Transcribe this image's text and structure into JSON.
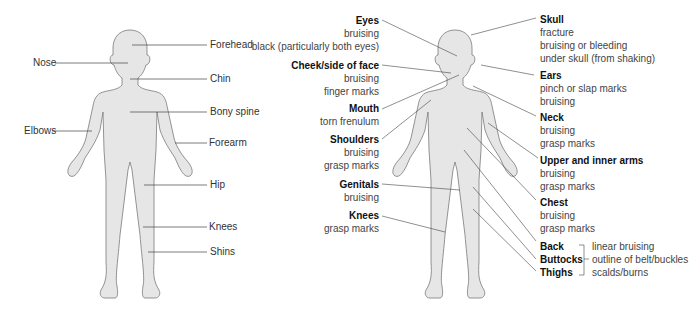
{
  "left_figure": {
    "labels": [
      {
        "id": "forehead",
        "text": "Forehead"
      },
      {
        "id": "nose",
        "text": "Nose"
      },
      {
        "id": "chin",
        "text": "Chin"
      },
      {
        "id": "bony_spine",
        "text": "Bony spine"
      },
      {
        "id": "elbows",
        "text": "Elbows"
      },
      {
        "id": "forearm",
        "text": "Forearm"
      },
      {
        "id": "hip",
        "text": "Hip"
      },
      {
        "id": "knees",
        "text": "Knees"
      },
      {
        "id": "shins",
        "text": "Shins"
      }
    ]
  },
  "right_figure": {
    "left_groups": [
      {
        "title": "Eyes",
        "lines": [
          "bruising",
          "black (particularly both eyes)"
        ]
      },
      {
        "title": "Cheek/side of face",
        "lines": [
          "bruising",
          "finger marks"
        ]
      },
      {
        "title": "Mouth",
        "lines": [
          "torn frenulum"
        ]
      },
      {
        "title": "Shoulders",
        "lines": [
          "bruising",
          "grasp marks"
        ]
      },
      {
        "title": "Genitals",
        "lines": [
          "bruising"
        ]
      },
      {
        "title": "Knees",
        "lines": [
          "grasp marks"
        ]
      }
    ],
    "right_groups": [
      {
        "title": "Skull",
        "lines": [
          "fracture",
          "bruising or bleeding",
          "under skull (from shaking)"
        ]
      },
      {
        "title": "Ears",
        "lines": [
          "pinch or slap marks",
          "bruising"
        ]
      },
      {
        "title": "Neck",
        "lines": [
          "bruising",
          "grasp marks"
        ]
      },
      {
        "title": "Upper and inner arms",
        "lines": [
          "bruising",
          "grasp marks"
        ]
      },
      {
        "title": "Chest",
        "lines": [
          "bruising",
          "grasp marks"
        ]
      }
    ],
    "bracket_group": {
      "titles": [
        "Back",
        "Buttocks",
        "Thighs"
      ],
      "lines": [
        "linear bruising",
        "outline of belt/buckles",
        "scalds/burns"
      ]
    }
  },
  "colors": {
    "body_fill": "#e6e6e6",
    "outline": "#777777",
    "leader": "#444444"
  }
}
